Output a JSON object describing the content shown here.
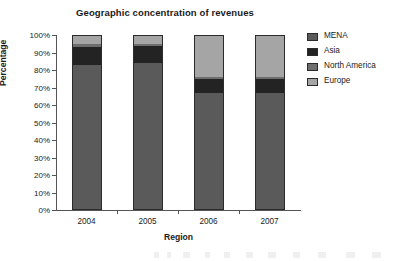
{
  "chart_data": {
    "type": "bar",
    "subtype": "stacked-percentage-column",
    "title": "Geographic concentration of revenues",
    "xlabel": "Region",
    "ylabel": "Percentage",
    "categories": [
      "2004",
      "2005",
      "2006",
      "2007"
    ],
    "ylim": [
      0,
      100
    ],
    "ytick_labels": [
      "0%",
      "10%",
      "20%",
      "30%",
      "40%",
      "50%",
      "60%",
      "70%",
      "80%",
      "90%",
      "100%"
    ],
    "ytick_values": [
      0,
      10,
      20,
      30,
      40,
      50,
      60,
      70,
      80,
      90,
      100
    ],
    "grid": false,
    "legend_position": "right",
    "stack_order_bottom_to_top": [
      "MENA",
      "Asia",
      "North America",
      "Europe"
    ],
    "series": [
      {
        "name": "MENA",
        "color": "#5a5a5a",
        "values": [
          83,
          84,
          67,
          67
        ]
      },
      {
        "name": "Asia",
        "color": "#232323",
        "values": [
          10,
          10,
          8,
          8
        ]
      },
      {
        "name": "North America",
        "color": "#6e6e6e",
        "values": [
          2,
          1,
          1,
          1
        ]
      },
      {
        "name": "Europe",
        "color": "#a5a5a5",
        "values": [
          5,
          5,
          24,
          24
        ]
      }
    ]
  },
  "legend": {
    "entries": [
      {
        "label": "MENA",
        "color": "#5a5a5a"
      },
      {
        "label": "Asia",
        "color": "#232323"
      },
      {
        "label": "North America",
        "color": "#6e6e6e"
      },
      {
        "label": "Europe",
        "color": "#a5a5a5"
      }
    ]
  },
  "colors": {
    "background": "#ffffff",
    "axis": "#555555",
    "bar_outline": "#2b2b2b",
    "text": "#1a1a1a"
  }
}
